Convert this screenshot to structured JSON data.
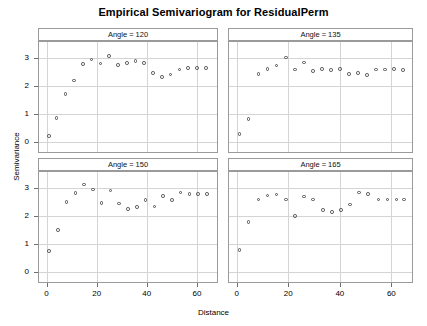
{
  "chart_data": {
    "type": "scatter",
    "title": "Empirical Semivariogram for ResidualPerm",
    "xlabel": "Distance",
    "ylabel": "Semivariance",
    "xlim": [
      -3,
      68
    ],
    "ylim": [
      -0.35,
      3.55
    ],
    "xticks": [
      0,
      20,
      40,
      60
    ],
    "yticks": [
      0,
      1,
      2,
      3
    ],
    "xtick_labels": [
      "0",
      "20",
      "40",
      "60"
    ],
    "ytick_labels": [
      "0",
      "1",
      "2",
      "3"
    ],
    "grid": true,
    "legend": "none",
    "layout": "2x2 trellis panels",
    "marker": "open-circle",
    "marker_color": "#4d4d52",
    "panels": [
      {
        "id": "angle-120",
        "strip_label": "Angle = 120",
        "row": 0,
        "col": 0,
        "x": [
          1.0,
          4.0,
          7.5,
          11.0,
          14.5,
          18.0,
          21.5,
          25.0,
          28.5,
          32.0,
          35.5,
          39.0,
          42.5,
          46.0,
          49.5,
          53.0,
          56.5,
          60.0,
          63.5
        ],
        "y": [
          0.21,
          0.86,
          1.7,
          2.19,
          2.77,
          2.93,
          2.79,
          3.05,
          2.73,
          2.8,
          2.88,
          2.8,
          2.45,
          2.3,
          2.4,
          2.58,
          2.62,
          2.62,
          2.62
        ]
      },
      {
        "id": "angle-135",
        "strip_label": "Angle = 135",
        "row": 0,
        "col": 1,
        "x": [
          1.0,
          4.5,
          8.5,
          12.0,
          15.5,
          19.0,
          22.5,
          26.0,
          29.5,
          33.0,
          36.5,
          40.0,
          43.5,
          47.0,
          50.5,
          54.0,
          57.5,
          61.0,
          64.5
        ],
        "y": [
          0.28,
          0.82,
          2.42,
          2.6,
          2.72,
          3.0,
          2.57,
          2.83,
          2.52,
          2.59,
          2.55,
          2.6,
          2.42,
          2.45,
          2.37,
          2.58,
          2.57,
          2.6,
          2.55
        ]
      },
      {
        "id": "angle-150",
        "strip_label": "Angle = 150",
        "row": 1,
        "col": 0,
        "x": [
          1.0,
          4.5,
          8.0,
          11.5,
          15.0,
          18.5,
          22.0,
          25.5,
          29.0,
          32.5,
          36.0,
          39.5,
          43.0,
          46.5,
          50.0,
          53.5,
          57.0,
          60.5,
          64.0
        ],
        "y": [
          0.74,
          1.5,
          2.49,
          2.81,
          3.11,
          2.93,
          2.45,
          2.89,
          2.44,
          2.23,
          2.31,
          2.56,
          2.32,
          2.69,
          2.56,
          2.82,
          2.78,
          2.78,
          2.78
        ]
      },
      {
        "id": "angle-165",
        "strip_label": "Angle = 165",
        "row": 1,
        "col": 1,
        "x": [
          1.0,
          4.5,
          8.5,
          12.0,
          15.5,
          19.0,
          22.5,
          26.0,
          29.5,
          33.5,
          37.0,
          40.5,
          44.0,
          47.5,
          51.0,
          55.0,
          58.5,
          62.0,
          65.0
        ],
        "y": [
          0.78,
          1.78,
          2.58,
          2.72,
          2.75,
          2.57,
          2.0,
          2.68,
          2.57,
          2.2,
          2.13,
          2.2,
          2.4,
          2.82,
          2.78,
          2.57,
          2.57,
          2.57,
          2.57
        ]
      }
    ]
  }
}
